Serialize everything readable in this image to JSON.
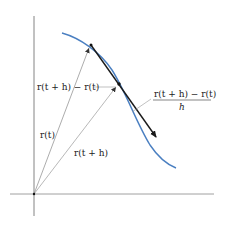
{
  "figure": {
    "colors": {
      "curve": "#4a7fc1",
      "arrow": "#1a1a1a",
      "axes": "#555555",
      "guides": "#999999"
    }
  },
  "labels": {
    "difference": "r(t + h) − r(t)",
    "quotient_numerator": "r(t + h) − r(t)",
    "quotient_denominator": "h",
    "r_t": "r(t)",
    "r_t_plus_h": "r(t + h)"
  }
}
